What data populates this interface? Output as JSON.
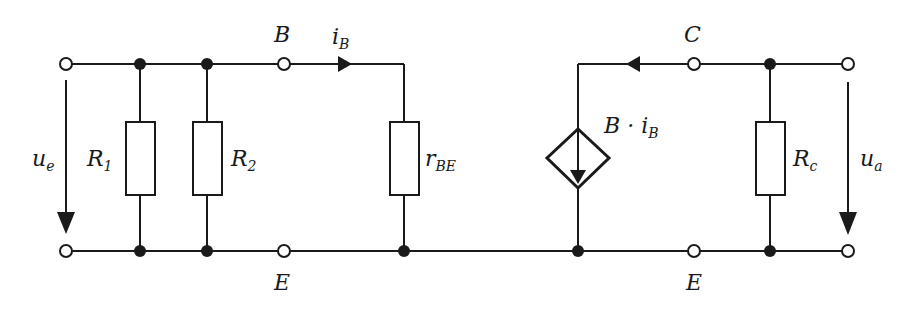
{
  "diagram": {
    "type": "small-signal transistor equivalent circuit",
    "labels": {
      "base": "B",
      "emitter_left": "E",
      "emitter_right": "E",
      "collector": "C",
      "input_voltage_main": "u",
      "input_voltage_sub": "e",
      "output_voltage_main": "u",
      "output_voltage_sub": "a",
      "r1_main": "R",
      "r1_sub": "1",
      "r2_main": "R",
      "r2_sub": "2",
      "rbe_main": "r",
      "rbe_sub": "BE",
      "rc_main": "R",
      "rc_sub": "c",
      "base_current_main": "i",
      "base_current_sub": "B",
      "source_main": "B · i",
      "source_sub": "B"
    },
    "components": [
      {
        "id": "R1",
        "type": "resistor"
      },
      {
        "id": "R2",
        "type": "resistor"
      },
      {
        "id": "rBE",
        "type": "resistor"
      },
      {
        "id": "B·iB",
        "type": "dependent current source"
      },
      {
        "id": "Rc",
        "type": "resistor"
      }
    ],
    "colors": {
      "stroke": "#1a1a1a",
      "background": "#ffffff"
    }
  }
}
